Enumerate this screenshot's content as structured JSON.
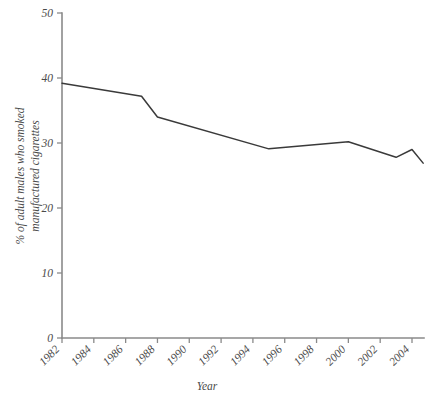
{
  "chart_data": {
    "type": "line",
    "title": "",
    "xlabel": "Year",
    "ylabel": "% of adult males who smoked manufactured cigarettes",
    "ylabel_line1": "% of adult males who smoked",
    "ylabel_line2": "manufactured cigarettes",
    "xlim": [
      1982,
      2004
    ],
    "ylim": [
      0,
      50
    ],
    "grid": false,
    "legend": "none",
    "y_ticks": [
      0,
      10,
      20,
      30,
      40,
      50
    ],
    "y_tick_labels": [
      "0",
      "10",
      "20",
      "30",
      "40",
      "50"
    ],
    "x_ticks": [
      1982,
      1984,
      1986,
      1988,
      1990,
      1992,
      1994,
      1996,
      1998,
      2000,
      2002,
      2004
    ],
    "x_tick_labels": [
      "1982",
      "1984",
      "1986",
      "1988",
      "1990",
      "1992",
      "1994",
      "1996",
      "1998",
      "2000",
      "2002",
      "2004"
    ],
    "x_tick_label_rotation": -45,
    "series": [
      {
        "name": "% of adult males who smoked manufactured cigarettes",
        "color": "#3a3a3a",
        "x": [
          1982,
          1987,
          1988,
          1995,
          2000,
          2003,
          2004,
          2004.7
        ],
        "values": [
          39.2,
          37.2,
          34.0,
          29.1,
          30.2,
          27.8,
          29.0,
          26.9
        ]
      }
    ],
    "points": [
      {
        "year": 1982,
        "value": 39.2
      },
      {
        "year": 1987,
        "value": 37.2
      },
      {
        "year": 1988,
        "value": 34.0
      },
      {
        "year": 1995,
        "value": 29.1
      },
      {
        "year": 2000,
        "value": 30.2
      },
      {
        "year": 2003,
        "value": 27.8
      },
      {
        "year": 2004,
        "value": 29.0
      },
      {
        "year": 2004.7,
        "value": 26.9
      }
    ],
    "colors": {
      "line": "#3a3a3a",
      "axis": "#8a8a8a",
      "text": "#4a4a4a",
      "background": "#ffffff"
    }
  }
}
